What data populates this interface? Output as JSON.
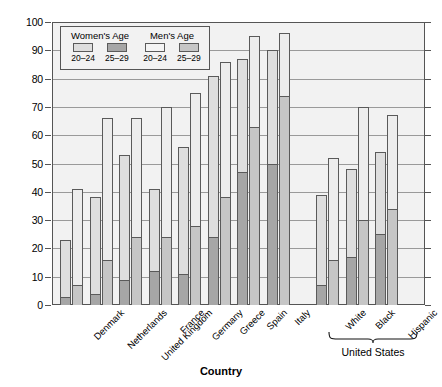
{
  "chart_data": {
    "type": "bar",
    "title": "",
    "xlabel": "Country",
    "ylabel": "Percent",
    "ylim": [
      0,
      100
    ],
    "yticks": [
      0,
      10,
      20,
      30,
      40,
      50,
      60,
      70,
      80,
      90,
      100
    ],
    "grid": true,
    "legend_position": "top-left",
    "stacked": true,
    "categories": [
      "Denmark",
      "Netherlands",
      "United Kingdom",
      "France",
      "Germany",
      "Greece",
      "Spain",
      "Italy",
      "White",
      "Black",
      "Hispanic"
    ],
    "group_annotation": {
      "label": "United States",
      "categories": [
        "White",
        "Black",
        "Hispanic"
      ]
    },
    "series": [
      {
        "name": "Women's Age 20-24",
        "values": [
          3,
          4,
          9,
          12,
          11,
          24,
          47,
          50,
          7,
          17,
          25
        ]
      },
      {
        "name": "Women's Age 25-29",
        "values": [
          23,
          38,
          53,
          41,
          56,
          81,
          87,
          90,
          39,
          48,
          54
        ]
      },
      {
        "name": "Men's Age 20-24",
        "values": [
          7,
          16,
          24,
          24,
          28,
          38,
          63,
          74,
          16,
          30,
          34
        ]
      },
      {
        "name": "Men's Age 25-29",
        "values": [
          41,
          66,
          66,
          70,
          75,
          86,
          95,
          96,
          52,
          70,
          67
        ]
      }
    ]
  },
  "legend": {
    "women_title": "Women's Age",
    "men_title": "Men's Age",
    "women_20_24": "20–24",
    "women_25_29": "25–29",
    "men_20_24": "20–24",
    "men_25_29": "25–29"
  },
  "axes": {
    "y_title": "Percent",
    "x_title": "Country",
    "y_ticks": [
      "100",
      "90",
      "80",
      "70",
      "60",
      "50",
      "40",
      "30",
      "20",
      "10",
      "0"
    ]
  },
  "colors": {
    "women_20_24": "#a6a6a6",
    "women_25_29": "#dedede",
    "men_20_24": "#c6c6c6",
    "men_25_29": "#ededed",
    "plot_background": "#f2f2f2",
    "gridline": "#9a9a9a",
    "outline": "#5a5a5a"
  }
}
